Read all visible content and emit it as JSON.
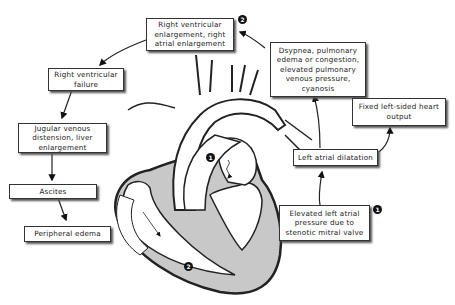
{
  "diagram": {
    "boxes": {
      "rv_enlargement": "Right ventricular enlargement, right atrial enlargement",
      "dyspnea": "Dsypnea, pulmonary edema or congestion, elevated pulmonary venous pressure, cyanosis",
      "fixed_output": "Fixed left-sided heart output",
      "la_dilatation": "Left atrial dilatation",
      "elevated_la": "Elevated left atrial pressure due to stenotic mitral valve",
      "rv_failure": "Right ventricular failure",
      "jugular": "Jugular venous distension, liver enlargement",
      "ascites": "Ascites",
      "edema": "Peripheral edema"
    },
    "badges": {
      "one": "1",
      "two": "2"
    },
    "colors": {
      "heart_wall": "#c8c8c8",
      "outline": "#222222",
      "badge": "#111111"
    }
  }
}
